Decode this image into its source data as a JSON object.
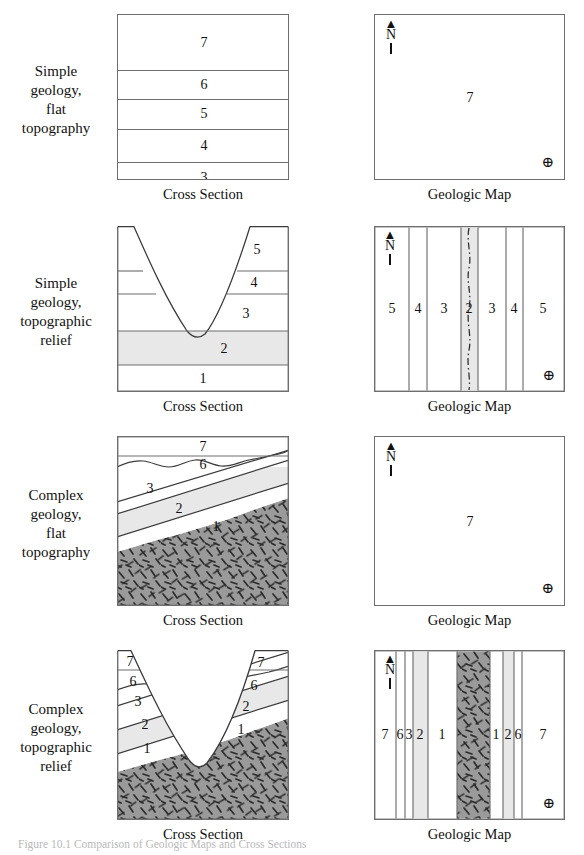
{
  "figure": {
    "caption": "Figure 10.1  Comparison of Geologic Maps and Cross Sections"
  },
  "colors": {
    "line": "#6e6e6e",
    "ink": "#1a1a1a",
    "unit2_fill": "#e8e8e8",
    "granite_fill": "#9a9a9a",
    "granite_dash": "#2b2b2b",
    "paper": "#ffffff"
  },
  "panel_captions": {
    "cross_section": "Cross Section",
    "geologic_map": "Geologic Map"
  },
  "compass": {
    "north_arrow": "north-arrow",
    "north_letter": "N",
    "benchmark_symbol": "⊕"
  },
  "rows": [
    {
      "id": "simple-flat",
      "label": "Simple geology,\nflat\ntopography",
      "label_lines": [
        "Simple",
        "geology,",
        "flat",
        "topography"
      ],
      "cross_section": {
        "type": "flat-layers",
        "layers": [
          {
            "unit": "7",
            "top_pct": 0,
            "bottom_pct": 33.5
          },
          {
            "unit": "6",
            "top_pct": 33.5,
            "bottom_pct": 50.5
          },
          {
            "unit": "5",
            "top_pct": 50.5,
            "bottom_pct": 68.5
          },
          {
            "unit": "4",
            "top_pct": 68.5,
            "bottom_pct": 88.5
          },
          {
            "unit": "3",
            "top_pct": 88.5,
            "bottom_pct": 100
          }
        ]
      },
      "geologic_map": {
        "type": "single-unit",
        "units": [
          {
            "unit": "7",
            "x_pct": 50,
            "y_pct": 50
          }
        ],
        "stream": false
      }
    },
    {
      "id": "simple-relief",
      "label_lines": [
        "Simple",
        "geology,",
        "topographic",
        "relief"
      ],
      "cross_section": {
        "type": "valley-layers",
        "layers": [
          {
            "unit": "5",
            "top_pct": 0,
            "bottom_pct": 27,
            "label_x_pct": 80
          },
          {
            "unit": "4",
            "top_pct": 27,
            "bottom_pct": 41,
            "label_x_pct": 80
          },
          {
            "unit": "3",
            "top_pct": 41,
            "bottom_pct": 63.5,
            "label_x_pct": 75
          },
          {
            "unit": "2",
            "top_pct": 63.5,
            "bottom_pct": 84,
            "label_x_pct": 62,
            "shaded": true
          },
          {
            "unit": "1",
            "top_pct": 84,
            "bottom_pct": 100,
            "label_x_pct": 50
          }
        ],
        "valley": {
          "left_rim_pct": 10,
          "right_rim_pct": 81,
          "floor_x_pct": 47,
          "floor_y_pct": 66
        }
      },
      "geologic_map": {
        "type": "banded",
        "bands": [
          {
            "unit": "5",
            "from_pct": 0,
            "to_pct": 18.5
          },
          {
            "unit": "4",
            "from_pct": 18.5,
            "to_pct": 27.5
          },
          {
            "unit": "3",
            "from_pct": 27.5,
            "to_pct": 45.5
          },
          {
            "unit": "2",
            "from_pct": 45.5,
            "to_pct": 54.5,
            "shaded": true,
            "stream": true
          },
          {
            "unit": "3",
            "from_pct": 54.5,
            "to_pct": 69
          },
          {
            "unit": "4",
            "from_pct": 69,
            "to_pct": 78
          },
          {
            "unit": "5",
            "from_pct": 78,
            "to_pct": 100
          }
        ],
        "stream": true
      }
    },
    {
      "id": "complex-flat",
      "label_lines": [
        "Complex",
        "geology,",
        "flat",
        "topography"
      ],
      "cross_section": {
        "type": "tilted-unconformity",
        "layers": [
          {
            "unit": "7",
            "label_x_pct": 50,
            "label_y_pct": 7
          },
          {
            "unit": "6",
            "label_x_pct": 50,
            "label_y_pct": 22
          },
          {
            "unit": "3",
            "label_x_pct": 19,
            "label_y_pct": 34
          },
          {
            "unit": "2",
            "label_x_pct": 36,
            "label_y_pct": 46,
            "shaded": true
          },
          {
            "unit": "1",
            "label_x_pct": 56,
            "label_y_pct": 58
          }
        ],
        "basement": {
          "unit": "granite",
          "pattern": "granite-dash"
        },
        "unconformity": true
      },
      "geologic_map": {
        "type": "single-unit",
        "units": [
          {
            "unit": "7",
            "x_pct": 50,
            "y_pct": 50
          }
        ],
        "stream": false
      }
    },
    {
      "id": "complex-relief",
      "label_lines": [
        "Complex",
        "geology,",
        "topographic",
        "relief"
      ],
      "cross_section": {
        "type": "valley-tilted",
        "layers": [
          {
            "unit": "7",
            "label_x_pct": 8,
            "label_y_pct": 8
          },
          {
            "unit": "6",
            "label_x_pct": 10,
            "label_y_pct": 22
          },
          {
            "unit": "3",
            "label_x_pct": 12,
            "label_y_pct": 36
          },
          {
            "unit": "2",
            "label_x_pct": 16,
            "label_y_pct": 51,
            "shaded": true
          },
          {
            "unit": "1",
            "label_x_pct": 17,
            "label_y_pct": 66
          },
          {
            "unit": "7",
            "label_x_pct": 83,
            "label_y_pct": 9
          },
          {
            "unit": "6",
            "label_x_pct": 79,
            "label_y_pct": 25
          },
          {
            "unit": "2",
            "label_x_pct": 75,
            "label_y_pct": 39,
            "shaded": true
          },
          {
            "unit": "1",
            "label_x_pct": 72,
            "label_y_pct": 53
          }
        ],
        "basement": {
          "unit": "granite",
          "pattern": "granite-dash"
        },
        "unconformity": true
      },
      "geologic_map": {
        "type": "banded",
        "bands": [
          {
            "unit": "7",
            "from_pct": 0,
            "to_pct": 11.5
          },
          {
            "unit": "6",
            "from_pct": 11.5,
            "to_pct": 16.5
          },
          {
            "unit": "3",
            "from_pct": 16.5,
            "to_pct": 20.5
          },
          {
            "unit": "2",
            "from_pct": 20.5,
            "to_pct": 28.5,
            "shaded": true
          },
          {
            "unit": "1",
            "from_pct": 28.5,
            "to_pct": 43.5
          },
          {
            "unit": "",
            "from_pct": 43.5,
            "to_pct": 60.5,
            "pattern": "granite-dash"
          },
          {
            "unit": "1",
            "from_pct": 60.5,
            "to_pct": 67.5
          },
          {
            "unit": "2",
            "from_pct": 67.5,
            "to_pct": 73.5,
            "shaded": true
          },
          {
            "unit": "6",
            "from_pct": 73.5,
            "to_pct": 77.5
          },
          {
            "unit": "7",
            "from_pct": 77.5,
            "to_pct": 100
          }
        ],
        "stream": false
      }
    }
  ]
}
